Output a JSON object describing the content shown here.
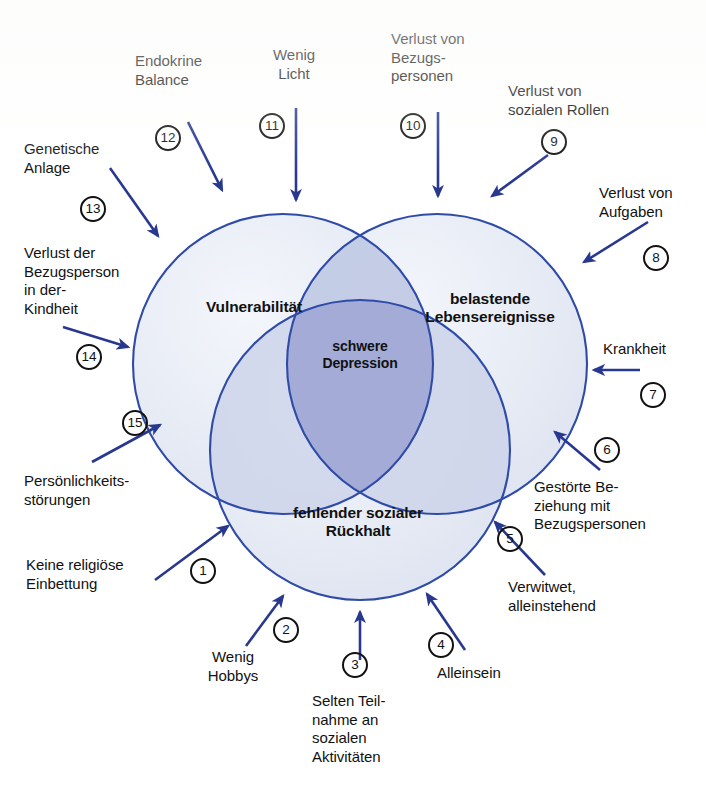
{
  "diagram": {
    "type": "venn-3-set",
    "colors": {
      "circle_stroke": "#2f4bA8",
      "circle_fill": "#e9edf6",
      "pair_overlap_fill": "#c3cbe6",
      "core_overlap_fill": "#a3abd6",
      "arrow": "#28388f",
      "badge_stroke": "#111111",
      "text": "#111111"
    },
    "sets": [
      {
        "id": "vulnerability",
        "label": "Vulnerabilität"
      },
      {
        "id": "life_events",
        "label": "belastende\nLebensereignisse"
      },
      {
        "id": "social_support",
        "label": "fehlender sozialer\nRückhalt"
      }
    ],
    "core": {
      "id": "severe_depression",
      "label": "schwere\nDepression"
    },
    "factors": [
      {
        "number": "1",
        "label": "Keine religiöse\nEinbettung",
        "target": "social_support"
      },
      {
        "number": "2",
        "label": "Wenig\nHobbys",
        "target": "social_support"
      },
      {
        "number": "3",
        "label": "Selten Teil-\nnahme an\nsozialen\nAktivitäten",
        "target": "social_support"
      },
      {
        "number": "4",
        "label": "Alleinsein",
        "target": "social_support"
      },
      {
        "number": "5",
        "label": "Verwitwet,\nalleinstehend",
        "target": "social_support"
      },
      {
        "number": "6",
        "label": "Gestörte Be-\nziehung mit\nBezugspersonen",
        "target": "life_events"
      },
      {
        "number": "7",
        "label": "Krankheit",
        "target": "life_events"
      },
      {
        "number": "8",
        "label": "Verlust von\nAufgaben",
        "target": "life_events"
      },
      {
        "number": "9",
        "label": "Verlust von\nsozialen Rollen",
        "target": "life_events"
      },
      {
        "number": "10",
        "label": "Verlust von\nBezugs-\npersonen",
        "target": "life_events"
      },
      {
        "number": "11",
        "label": "Wenig\nLicht",
        "target": "vulnerability"
      },
      {
        "number": "12",
        "label": "Endokrine\nBalance",
        "target": "vulnerability"
      },
      {
        "number": "13",
        "label": "Genetische\nAnlage",
        "target": "vulnerability"
      },
      {
        "number": "14",
        "label": "Verlust der\nBezugsperson\nin der-\nKindheit",
        "target": "vulnerability"
      },
      {
        "number": "15",
        "label": "Persönlichkeits-\nstörungen",
        "target": "vulnerability"
      }
    ]
  }
}
